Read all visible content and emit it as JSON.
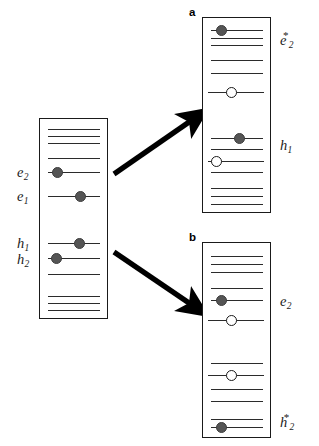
{
  "figure": {
    "type": "energy-level-diagram",
    "colors": {
      "level_line": "#2b2b2b",
      "box_border": "#1a1a1a",
      "electron_fill": "#555555",
      "hole_fill": "#ffffff",
      "arrow": "#000000",
      "background": "#ffffff"
    }
  },
  "center_panel": {
    "name": "ground-state-panel",
    "box": {
      "x": 39,
      "y": 118,
      "w": 69,
      "h": 201
    },
    "levels": [
      {
        "id": "c-t1",
        "x": 48,
        "y": 129,
        "w": 52
      },
      {
        "id": "c-t2",
        "x": 48,
        "y": 136,
        "w": 52
      },
      {
        "id": "c-t3",
        "x": 48,
        "y": 143,
        "w": 52
      },
      {
        "id": "c-t4",
        "x": 48,
        "y": 158,
        "w": 52
      },
      {
        "id": "c-e2",
        "x": 48,
        "y": 172,
        "w": 52
      },
      {
        "id": "c-e1",
        "x": 48,
        "y": 196,
        "w": 52
      },
      {
        "id": "c-h1",
        "x": 48,
        "y": 243,
        "w": 52
      },
      {
        "id": "c-h2",
        "x": 48,
        "y": 258,
        "w": 52
      },
      {
        "id": "c-b1",
        "x": 48,
        "y": 274,
        "w": 52
      },
      {
        "id": "c-b2",
        "x": 48,
        "y": 296,
        "w": 52
      },
      {
        "id": "c-b3",
        "x": 48,
        "y": 303,
        "w": 52
      },
      {
        "id": "c-b4",
        "x": 48,
        "y": 310,
        "w": 52
      }
    ],
    "particles": [
      {
        "id": "c-p1",
        "kind": "electron",
        "x": 57,
        "y": 172
      },
      {
        "id": "c-p2",
        "kind": "electron",
        "x": 80,
        "y": 196
      },
      {
        "id": "c-p3",
        "kind": "electron",
        "x": 79,
        "y": 243
      },
      {
        "id": "c-p4",
        "kind": "electron",
        "x": 56,
        "y": 258
      }
    ],
    "labels": [
      {
        "id": "lbl-e2",
        "base": "e",
        "sub": "2",
        "star": false,
        "x": 17,
        "y": 165
      },
      {
        "id": "lbl-e1",
        "base": "e",
        "sub": "1",
        "star": false,
        "x": 17,
        "y": 189
      },
      {
        "id": "lbl-h1",
        "base": "h",
        "sub": "1",
        "star": false,
        "x": 17,
        "y": 236
      },
      {
        "id": "lbl-h2",
        "base": "h",
        "sub": "2",
        "star": false,
        "x": 17,
        "y": 252
      }
    ]
  },
  "panel_a": {
    "name": "panel-a",
    "tag": "a",
    "tag_pos": {
      "x": 189,
      "y": 6
    },
    "box": {
      "x": 202,
      "y": 17,
      "w": 69,
      "h": 196
    },
    "levels": [
      {
        "id": "a-1",
        "x": 211,
        "y": 30,
        "w": 52
      },
      {
        "id": "a-2",
        "x": 211,
        "y": 38,
        "w": 52
      },
      {
        "id": "a-3",
        "x": 211,
        "y": 45,
        "w": 52
      },
      {
        "id": "a-4",
        "x": 211,
        "y": 60,
        "w": 52
      },
      {
        "id": "a-5",
        "x": 211,
        "y": 73,
        "w": 52
      },
      {
        "id": "a-6",
        "x": 208,
        "y": 92,
        "w": 56
      },
      {
        "id": "a-7",
        "x": 211,
        "y": 138,
        "w": 52
      },
      {
        "id": "a-8",
        "x": 211,
        "y": 149,
        "w": 52
      },
      {
        "id": "a-9",
        "x": 208,
        "y": 161,
        "w": 56
      },
      {
        "id": "a-10",
        "x": 211,
        "y": 172,
        "w": 52
      },
      {
        "id": "a-11",
        "x": 211,
        "y": 188,
        "w": 52
      },
      {
        "id": "a-12",
        "x": 211,
        "y": 196,
        "w": 52
      },
      {
        "id": "a-13",
        "x": 211,
        "y": 204,
        "w": 52
      }
    ],
    "particles": [
      {
        "id": "a-p1",
        "kind": "electron",
        "x": 221,
        "y": 30
      },
      {
        "id": "a-p2",
        "kind": "hole",
        "x": 231,
        "y": 92
      },
      {
        "id": "a-p3",
        "kind": "electron",
        "x": 239,
        "y": 138
      },
      {
        "id": "a-p4",
        "kind": "hole",
        "x": 216,
        "y": 161
      }
    ],
    "labels": [
      {
        "id": "lbl-e2-star",
        "base": "e",
        "sub": "2",
        "star": true,
        "x": 280,
        "y": 30
      },
      {
        "id": "lbl-h1-a",
        "base": "h",
        "sub": "1",
        "star": false,
        "x": 280,
        "y": 138
      }
    ]
  },
  "panel_b": {
    "name": "panel-b",
    "tag": "b",
    "tag_pos": {
      "x": 189,
      "y": 231
    },
    "box": {
      "x": 202,
      "y": 242,
      "w": 69,
      "h": 196
    },
    "levels": [
      {
        "id": "b-1",
        "x": 211,
        "y": 256,
        "w": 52
      },
      {
        "id": "b-2",
        "x": 211,
        "y": 264,
        "w": 52
      },
      {
        "id": "b-3",
        "x": 211,
        "y": 272,
        "w": 52
      },
      {
        "id": "b-4",
        "x": 211,
        "y": 288,
        "w": 52
      },
      {
        "id": "b-5",
        "x": 211,
        "y": 300,
        "w": 52
      },
      {
        "id": "b-6",
        "x": 208,
        "y": 320,
        "w": 56
      },
      {
        "id": "b-7",
        "x": 211,
        "y": 363,
        "w": 52
      },
      {
        "id": "b-8",
        "x": 208,
        "y": 375,
        "w": 56
      },
      {
        "id": "b-9",
        "x": 211,
        "y": 389,
        "w": 52
      },
      {
        "id": "b-10",
        "x": 211,
        "y": 401,
        "w": 52
      },
      {
        "id": "b-11",
        "x": 211,
        "y": 419,
        "w": 52
      },
      {
        "id": "b-12",
        "x": 211,
        "y": 427,
        "w": 52
      }
    ],
    "particles": [
      {
        "id": "b-p1",
        "kind": "electron",
        "x": 221,
        "y": 300
      },
      {
        "id": "b-p2",
        "kind": "hole",
        "x": 231,
        "y": 320
      },
      {
        "id": "b-p3",
        "kind": "hole",
        "x": 231,
        "y": 375
      },
      {
        "id": "b-p4",
        "kind": "electron",
        "x": 221,
        "y": 427
      }
    ],
    "labels": [
      {
        "id": "lbl-e2-b",
        "base": "e",
        "sub": "2",
        "star": false,
        "x": 280,
        "y": 294
      },
      {
        "id": "lbl-h2-star",
        "base": "h",
        "sub": "2",
        "star": true,
        "x": 280,
        "y": 412
      }
    ]
  },
  "arrows": [
    {
      "id": "arrow-up",
      "name": "arrow-to-panel-a",
      "x1": 114,
      "y1": 174,
      "x2": 192,
      "y2": 120
    },
    {
      "id": "arrow-down",
      "name": "arrow-to-panel-b",
      "x1": 114,
      "y1": 252,
      "x2": 192,
      "y2": 305
    }
  ]
}
